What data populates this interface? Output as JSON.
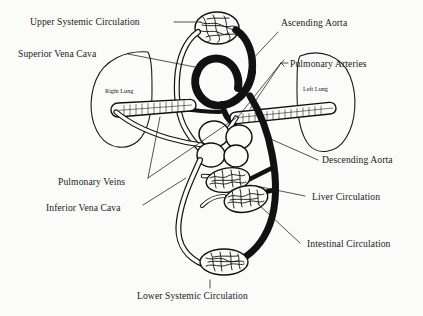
{
  "figure": {
    "ink_color": "#111111",
    "background_color": "#fbfbfa"
  },
  "labels": {
    "upper_systemic": "Upper Systemic Circulation",
    "superior_vena_cava": "Superior Vena Cava",
    "ascending_aorta": "Ascending Aorta",
    "pulmonary_arteries": "Pulmonary Arteries",
    "right_lung": "Right Lung",
    "left_lung": "Left Lung",
    "descending_aorta": "Descending Aorta",
    "pulmonary_veins": "Pulmonary Veins",
    "inferior_vena_cava": "Inferior Vena Cava",
    "liver_circulation": "Liver Circulation",
    "intestinal_circulation": "Intestinal Circulation",
    "lower_systemic": "Lower Systemic Circulation"
  }
}
